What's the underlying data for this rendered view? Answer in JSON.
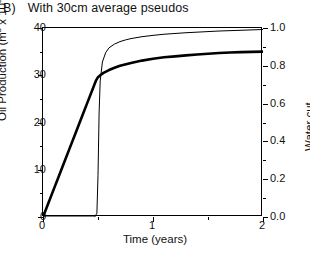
{
  "panel": {
    "letter": "B)",
    "title": "With 30cm average pseudos"
  },
  "chart_data": {
    "type": "line",
    "title": "With 30cm average pseudos",
    "xlabel": "Time (years)",
    "ylabel": "Oil Production (m3 x 103)",
    "y2label": "Water cut",
    "xlim": [
      0,
      2
    ],
    "ylim": [
      0,
      40
    ],
    "y2lim": [
      0.0,
      1.0
    ],
    "grid": false,
    "legend": "none",
    "xticks": [
      0,
      1,
      2
    ],
    "xticklabels": [
      "0",
      "1",
      "2"
    ],
    "xminorticks": [
      0.5,
      1.5
    ],
    "yticks": [
      0,
      10,
      20,
      30,
      40
    ],
    "yticklabels": [
      "0",
      "10",
      "20",
      "30",
      "40"
    ],
    "yminorticks": [
      5,
      15,
      25,
      35
    ],
    "y2ticks": [
      0.0,
      0.2,
      0.4,
      0.6,
      0.8,
      1.0
    ],
    "y2ticklabels": [
      "0.0",
      "0.2",
      "0.4",
      "0.6",
      "0.8",
      "1.0"
    ],
    "y2minorticks": [
      0.1,
      0.3,
      0.5,
      0.7,
      0.9
    ],
    "series": [
      {
        "name": "Oil Production",
        "axis": "left",
        "style": "thick-solid",
        "color": "#000000",
        "linewidth": 2.6,
        "x": [
          0.0,
          0.05,
          0.1,
          0.15,
          0.2,
          0.25,
          0.3,
          0.35,
          0.4,
          0.45,
          0.48,
          0.5,
          0.52,
          0.55,
          0.6,
          0.65,
          0.7,
          0.8,
          0.9,
          1.0,
          1.1,
          1.2,
          1.3,
          1.4,
          1.5,
          1.6,
          1.7,
          1.8,
          1.9,
          2.0
        ],
        "y": [
          0.0,
          3.0,
          6.0,
          9.0,
          12.0,
          15.0,
          18.0,
          21.0,
          24.0,
          27.0,
          28.8,
          29.6,
          30.0,
          30.5,
          31.1,
          31.6,
          32.0,
          32.6,
          33.1,
          33.5,
          33.8,
          34.0,
          34.2,
          34.4,
          34.55,
          34.7,
          34.8,
          34.9,
          34.95,
          35.0
        ]
      },
      {
        "name": "Water cut",
        "axis": "right",
        "style": "thin-solid",
        "color": "#000000",
        "linewidth": 1.0,
        "x": [
          0.0,
          0.4,
          0.47,
          0.49,
          0.5,
          0.51,
          0.52,
          0.54,
          0.57,
          0.6,
          0.65,
          0.7,
          0.75,
          0.8,
          0.9,
          1.0,
          1.1,
          1.2,
          1.3,
          1.4,
          1.5,
          1.6,
          1.7,
          1.8,
          1.9,
          2.0
        ],
        "y": [
          0.0,
          0.0,
          0.0,
          0.02,
          0.22,
          0.55,
          0.72,
          0.82,
          0.87,
          0.895,
          0.915,
          0.928,
          0.937,
          0.944,
          0.954,
          0.961,
          0.967,
          0.971,
          0.975,
          0.978,
          0.981,
          0.984,
          0.986,
          0.988,
          0.99,
          0.992
        ]
      }
    ],
    "annotations": {
      "breakthrough_time": 0.5,
      "oil_at_breakthrough": 30.0
    }
  },
  "axes": {
    "y_left": {
      "title_main": "Oil Production (m",
      "title_sup1": "3",
      "title_mid": " x 10",
      "title_sup2": "3",
      "title_end": ")"
    },
    "y_right": {
      "title": "Water cut"
    },
    "x": {
      "title": "Time (years)"
    }
  }
}
